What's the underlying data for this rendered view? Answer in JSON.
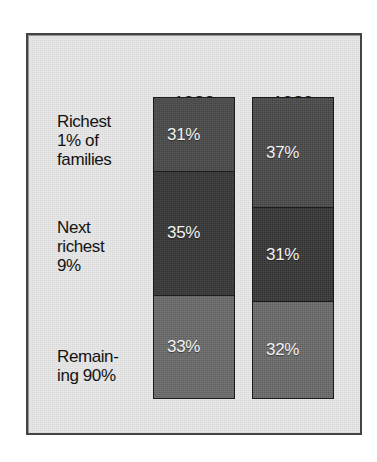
{
  "chart_data": {
    "type": "bar",
    "subtype": "stacked-column-100",
    "title": "",
    "xlabel": "",
    "ylabel": "",
    "categories": [
      "1983",
      "1989"
    ],
    "series": [
      {
        "name": "Richest 1% of families",
        "values": [
          31,
          37
        ],
        "labels": [
          "31%",
          "37%"
        ],
        "color": "#4d4d4d"
      },
      {
        "name": "Next richest 9%",
        "values": [
          35,
          31
        ],
        "labels": [
          "35%",
          "31%"
        ],
        "color": "#393939"
      },
      {
        "name": "Remaining 90%",
        "values": [
          33,
          32
        ],
        "labels": [
          "33%",
          "32%"
        ],
        "color": "#6f6f6f"
      }
    ],
    "ylim": [
      0,
      99
    ],
    "grid": false,
    "legend": "row-labels-left",
    "units": "percent"
  },
  "columns": {
    "year_1983": "1983",
    "year_1989": "1989"
  },
  "row_labels": [
    {
      "line1": "Richest",
      "line2": "1% of",
      "line3": "families"
    },
    {
      "line1": "Next",
      "line2": "richest",
      "line3": "9%"
    },
    {
      "line1": "Remain-",
      "line2": "ing 90%",
      "line3": ""
    }
  ],
  "bars": {
    "y1983": [
      {
        "value": "31%",
        "color": "#4d4d4d",
        "height_pct": 24.6
      },
      {
        "value": "35%",
        "color": "#393939",
        "height_pct": 41.3
      },
      {
        "value": "33%",
        "color": "#6f6f6f",
        "height_pct": 34.1
      }
    ],
    "y1989": [
      {
        "value": "37%",
        "color": "#4d4d4d",
        "height_pct": 36.7
      },
      {
        "value": "31%",
        "color": "#393939",
        "height_pct": 31.2
      },
      {
        "value": "32%",
        "color": "#6f6f6f",
        "height_pct": 32.1
      }
    ]
  },
  "colors": {
    "panel_background": "#e9e9e9",
    "frame_border": "#444444",
    "segment_top": "#4d4d4d",
    "segment_middle": "#393939",
    "segment_bottom": "#6f6f6f",
    "label_text": "#141414",
    "value_text": "#f2f2f2"
  }
}
